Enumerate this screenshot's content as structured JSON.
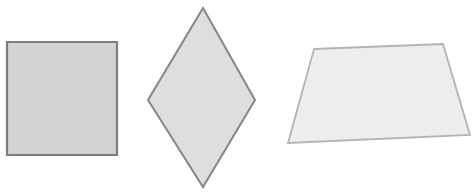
{
  "canvas": {
    "width": 474,
    "height": 192,
    "background_color": "#ffffff",
    "description": "Three outlined gray geometric quadrilaterals on a plain white background"
  },
  "shapes": [
    {
      "id": "square",
      "name": "square",
      "label": "Square",
      "points": "7,42 117,42 117,155 7,155",
      "fill": "#d2d3d3",
      "stroke": "#7c7d7f",
      "stroke_width": 2.2,
      "vertices": [
        {
          "x": 7,
          "y": 42
        },
        {
          "x": 117,
          "y": 42
        },
        {
          "x": 117,
          "y": 155
        },
        {
          "x": 7,
          "y": 155
        }
      ],
      "center": {
        "x": 62,
        "y": 98
      },
      "width": 110,
      "height": 113,
      "sides": 4
    },
    {
      "id": "rhombus",
      "name": "rhombus",
      "label": "Rhombus",
      "points": "203,8 255,100 203,187 148,100",
      "fill": "#dededd",
      "stroke": "#868789",
      "stroke_width": 2.0,
      "vertices": [
        {
          "x": 203,
          "y": 8
        },
        {
          "x": 255,
          "y": 100
        },
        {
          "x": 203,
          "y": 187
        },
        {
          "x": 148,
          "y": 100
        }
      ],
      "center": {
        "x": 202,
        "y": 98
      },
      "width": 107,
      "height": 179,
      "sides": 4
    },
    {
      "id": "trapezoid",
      "name": "trapezoid",
      "label": "Trapezoid",
      "points": "314,49 443,44 470,135 288,143",
      "fill": "#ededec",
      "stroke": "#b2b3b3",
      "stroke_width": 1.8,
      "vertices": [
        {
          "x": 314,
          "y": 49
        },
        {
          "x": 443,
          "y": 44
        },
        {
          "x": 470,
          "y": 135
        },
        {
          "x": 288,
          "y": 143
        }
      ],
      "center": {
        "x": 379,
        "y": 93
      },
      "width": 182,
      "height": 99,
      "sides": 4
    }
  ]
}
